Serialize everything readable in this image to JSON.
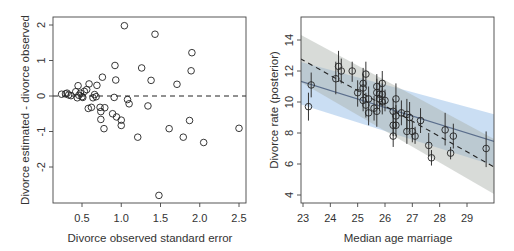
{
  "chart_data": [
    {
      "type": "scatter",
      "title": "",
      "xlabel": "Divorce observed standard error",
      "ylabel": "Divorce estimated - divorce observed",
      "xlim": [
        0.15,
        2.6
      ],
      "ylim": [
        -2.9,
        2.1
      ],
      "xticks": [
        0.5,
        1.0,
        1.5,
        2.0,
        2.5
      ],
      "xtick_labels": [
        "0.5",
        "1.0",
        "1.5",
        "2.0",
        "2.5"
      ],
      "yticks": [
        -2,
        -1,
        0,
        1,
        2
      ],
      "ytick_labels": [
        "-2",
        "-1",
        "0",
        "1",
        "2"
      ],
      "grid": false,
      "reference_line": {
        "y": 0,
        "style": "dashed"
      },
      "points": [
        {
          "x": 0.24,
          "y": 0.05
        },
        {
          "x": 0.29,
          "y": 0.06
        },
        {
          "x": 0.31,
          "y": 0.08
        },
        {
          "x": 0.33,
          "y": 0.03
        },
        {
          "x": 0.36,
          "y": 0.01
        },
        {
          "x": 0.42,
          "y": 0.12
        },
        {
          "x": 0.44,
          "y": -0.05
        },
        {
          "x": 0.45,
          "y": 0.29
        },
        {
          "x": 0.46,
          "y": 0.02
        },
        {
          "x": 0.48,
          "y": 0.08
        },
        {
          "x": 0.5,
          "y": -0.02
        },
        {
          "x": 0.51,
          "y": -0.04
        },
        {
          "x": 0.53,
          "y": 0.13
        },
        {
          "x": 0.56,
          "y": 0.18
        },
        {
          "x": 0.58,
          "y": -0.35
        },
        {
          "x": 0.59,
          "y": 0.34
        },
        {
          "x": 0.62,
          "y": -0.32
        },
        {
          "x": 0.64,
          "y": -0.05
        },
        {
          "x": 0.66,
          "y": 0.04
        },
        {
          "x": 0.68,
          "y": -0.02
        },
        {
          "x": 0.69,
          "y": 0.3
        },
        {
          "x": 0.73,
          "y": -0.32
        },
        {
          "x": 0.74,
          "y": -0.44
        },
        {
          "x": 0.74,
          "y": -0.66
        },
        {
          "x": 0.76,
          "y": 0.53
        },
        {
          "x": 0.78,
          "y": -0.92
        },
        {
          "x": 0.79,
          "y": -0.33
        },
        {
          "x": 0.89,
          "y": -0.5
        },
        {
          "x": 0.91,
          "y": -0.04
        },
        {
          "x": 0.92,
          "y": 0.86
        },
        {
          "x": 0.93,
          "y": 0.45
        },
        {
          "x": 0.94,
          "y": -0.59
        },
        {
          "x": 1.0,
          "y": -0.68
        },
        {
          "x": 1.0,
          "y": -0.83
        },
        {
          "x": 1.04,
          "y": 1.98
        },
        {
          "x": 1.08,
          "y": -0.1
        },
        {
          "x": 1.1,
          "y": -0.22
        },
        {
          "x": 1.21,
          "y": -1.16
        },
        {
          "x": 1.26,
          "y": 0.79
        },
        {
          "x": 1.34,
          "y": -0.28
        },
        {
          "x": 1.38,
          "y": 0.44
        },
        {
          "x": 1.43,
          "y": 1.74
        },
        {
          "x": 1.48,
          "y": -2.8
        },
        {
          "x": 1.61,
          "y": -0.92
        },
        {
          "x": 1.71,
          "y": 0.33
        },
        {
          "x": 1.79,
          "y": -1.16
        },
        {
          "x": 1.87,
          "y": -0.69
        },
        {
          "x": 1.89,
          "y": 0.71
        },
        {
          "x": 1.9,
          "y": 1.22
        },
        {
          "x": 2.05,
          "y": -1.31
        },
        {
          "x": 2.5,
          "y": -0.91
        }
      ]
    },
    {
      "type": "scatter",
      "title": "",
      "xlabel": "Median age marriage",
      "ylabel": "Divorce rate (posterior)",
      "xlim": [
        22.9,
        30.0
      ],
      "ylim": [
        3.6,
        15.5
      ],
      "xticks": [
        23,
        24,
        25,
        26,
        27,
        28,
        29
      ],
      "xtick_labels": [
        "23",
        "24",
        "25",
        "26",
        "27",
        "28",
        "29"
      ],
      "yticks": [
        4,
        6,
        8,
        10,
        12,
        14
      ],
      "ytick_labels": [
        "4",
        "6",
        "8",
        "10",
        "12",
        "14"
      ],
      "grid": false,
      "regression_lines": [
        {
          "name": "posterior fit",
          "style": "solid",
          "color": "#5b6e8c",
          "x": [
            22.9,
            30.0
          ],
          "y": [
            11.35,
            7.45
          ],
          "band": {
            "color": "#9ec3ea",
            "opacity": 0.55,
            "lower": [
              9.85,
              5.9
            ],
            "upper": [
              12.6,
              9.2
            ]
          }
        },
        {
          "name": "observed fit",
          "style": "dashed",
          "color": "#222222",
          "x": [
            22.9,
            30.0
          ],
          "y": [
            12.8,
            5.8
          ],
          "band": {
            "color": "#a9b0a9",
            "opacity": 0.45,
            "lower": [
              11.3,
              4.05
            ],
            "upper": [
              14.35,
              7.6
            ]
          }
        }
      ],
      "points": [
        {
          "x": 23.2,
          "y": 9.7,
          "lo": 8.8,
          "hi": 10.6
        },
        {
          "x": 23.3,
          "y": 11.1,
          "lo": 10.3,
          "hi": 11.9
        },
        {
          "x": 24.2,
          "y": 11.5,
          "lo": 10.5,
          "hi": 12.6
        },
        {
          "x": 24.3,
          "y": 12.3,
          "lo": 11.3,
          "hi": 13.3
        },
        {
          "x": 24.4,
          "y": 12.0,
          "lo": 11.2,
          "hi": 12.8
        },
        {
          "x": 24.8,
          "y": 12.0,
          "lo": 11.3,
          "hi": 12.6
        },
        {
          "x": 25.0,
          "y": 10.6,
          "lo": 9.7,
          "hi": 11.4
        },
        {
          "x": 25.2,
          "y": 11.2,
          "lo": 10.3,
          "hi": 12.2
        },
        {
          "x": 25.2,
          "y": 10.9,
          "lo": 10.0,
          "hi": 11.8
        },
        {
          "x": 25.2,
          "y": 10.1,
          "lo": 9.4,
          "hi": 10.8
        },
        {
          "x": 25.3,
          "y": 11.8,
          "lo": 10.9,
          "hi": 12.6
        },
        {
          "x": 25.3,
          "y": 9.8,
          "lo": 9.0,
          "hi": 10.6
        },
        {
          "x": 25.4,
          "y": 10.2,
          "lo": 9.4,
          "hi": 11.0
        },
        {
          "x": 25.4,
          "y": 9.3,
          "lo": 8.5,
          "hi": 10.1
        },
        {
          "x": 25.6,
          "y": 9.6,
          "lo": 8.8,
          "hi": 10.4
        },
        {
          "x": 25.7,
          "y": 11.0,
          "lo": 10.2,
          "hi": 11.8
        },
        {
          "x": 25.7,
          "y": 10.6,
          "lo": 9.6,
          "hi": 11.5
        },
        {
          "x": 25.7,
          "y": 9.4,
          "lo": 8.4,
          "hi": 10.3
        },
        {
          "x": 25.8,
          "y": 10.5,
          "lo": 9.7,
          "hi": 11.3
        },
        {
          "x": 25.8,
          "y": 10.2,
          "lo": 9.4,
          "hi": 11.0
        },
        {
          "x": 25.9,
          "y": 11.2,
          "lo": 10.4,
          "hi": 12.0
        },
        {
          "x": 25.9,
          "y": 10.5,
          "lo": 9.8,
          "hi": 11.2
        },
        {
          "x": 25.9,
          "y": 10.0,
          "lo": 9.2,
          "hi": 10.8
        },
        {
          "x": 26.0,
          "y": 10.1,
          "lo": 9.4,
          "hi": 10.8
        },
        {
          "x": 26.3,
          "y": 9.4,
          "lo": 8.6,
          "hi": 10.2
        },
        {
          "x": 26.3,
          "y": 8.5,
          "lo": 7.8,
          "hi": 9.2
        },
        {
          "x": 26.3,
          "y": 7.8,
          "lo": 7.1,
          "hi": 8.5
        },
        {
          "x": 26.4,
          "y": 10.2,
          "lo": 9.2,
          "hi": 11.2
        },
        {
          "x": 26.4,
          "y": 9.1,
          "lo": 8.4,
          "hi": 9.8
        },
        {
          "x": 26.4,
          "y": 8.5,
          "lo": 7.8,
          "hi": 9.2
        },
        {
          "x": 26.6,
          "y": 9.3,
          "lo": 8.5,
          "hi": 10.1
        },
        {
          "x": 26.8,
          "y": 9.2,
          "lo": 8.2,
          "hi": 10.2
        },
        {
          "x": 26.8,
          "y": 8.1,
          "lo": 7.3,
          "hi": 8.9
        },
        {
          "x": 26.9,
          "y": 9.0,
          "lo": 8.1,
          "hi": 10.0
        },
        {
          "x": 27.0,
          "y": 8.1,
          "lo": 7.4,
          "hi": 8.8
        },
        {
          "x": 27.1,
          "y": 7.8,
          "lo": 7.3,
          "hi": 8.4
        },
        {
          "x": 27.3,
          "y": 8.8,
          "lo": 8.0,
          "hi": 9.6
        },
        {
          "x": 27.6,
          "y": 7.2,
          "lo": 6.5,
          "hi": 8.0
        },
        {
          "x": 27.7,
          "y": 6.4,
          "lo": 5.9,
          "hi": 6.9
        },
        {
          "x": 28.2,
          "y": 8.2,
          "lo": 7.2,
          "hi": 9.3
        },
        {
          "x": 28.4,
          "y": 6.7,
          "lo": 6.3,
          "hi": 7.1
        },
        {
          "x": 28.5,
          "y": 7.8,
          "lo": 7.0,
          "hi": 8.6
        },
        {
          "x": 29.7,
          "y": 7.0,
          "lo": 5.8,
          "hi": 8.1
        }
      ]
    }
  ],
  "panels": [
    {
      "xlabel": "Divorce observed standard error",
      "ylabel": "Divorce estimated - divorce observed"
    },
    {
      "xlabel": "Median age marriage",
      "ylabel": "Divorce rate (posterior)"
    }
  ]
}
